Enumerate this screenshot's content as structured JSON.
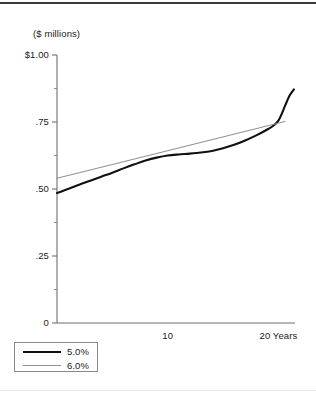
{
  "chart_data": {
    "type": "line",
    "title": "",
    "subtitle": "",
    "unit_label": "($ millions)",
    "xlabel": "",
    "ylabel": "",
    "xlim": [
      0,
      21.5
    ],
    "ylim": [
      0,
      1.0
    ],
    "grid": false,
    "legend_position": "bottom-left",
    "y_ticks": [
      {
        "value": 1.0,
        "label": "$1.00"
      },
      {
        "value": 0.75,
        "label": ".75"
      },
      {
        "value": 0.5,
        "label": ".50"
      },
      {
        "value": 0.25,
        "label": ".25"
      },
      {
        "value": 0,
        "label": "0"
      }
    ],
    "y_minor_ticks": [
      0.875,
      0.625,
      0.375,
      0.125
    ],
    "x_ticks": [
      {
        "value": 10,
        "label": "10"
      },
      {
        "value": 20,
        "label": "20 Years"
      }
    ],
    "series": [
      {
        "name": "5.0%",
        "color": "#111111",
        "width": 2.1,
        "x": [
          0,
          1,
          2,
          3,
          4,
          5,
          6,
          7,
          8,
          9,
          10,
          11,
          12,
          13,
          14,
          15,
          16,
          17,
          18,
          19,
          19.6,
          20,
          20.3,
          20.6,
          21,
          21.4
        ],
        "values": [
          0.485,
          0.5,
          0.516,
          0.531,
          0.546,
          0.561,
          0.577,
          0.592,
          0.606,
          0.617,
          0.625,
          0.629,
          0.632,
          0.636,
          0.642,
          0.652,
          0.665,
          0.681,
          0.7,
          0.722,
          0.738,
          0.755,
          0.78,
          0.81,
          0.848,
          0.872
        ]
      },
      {
        "name": "6.0%",
        "color": "#8d8d8d",
        "width": 1.0,
        "x": [
          0,
          20.6
        ],
        "values": [
          0.54,
          0.752
        ]
      }
    ]
  },
  "legend": {
    "entries": [
      {
        "label": "5.0%"
      },
      {
        "label": "6.0%"
      }
    ]
  },
  "axis": {
    "unit_label": "($ millions)"
  }
}
